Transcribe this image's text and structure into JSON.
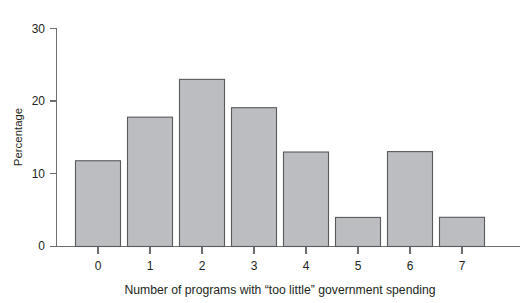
{
  "figure": {
    "cropped_header": "",
    "background_color": "#ffffff"
  },
  "chart_data": {
    "type": "bar",
    "title": "",
    "xlabel": "Number of programs with “too little” government spending",
    "ylabel": "Percentage",
    "categories": [
      "0",
      "1",
      "2",
      "3",
      "4",
      "5",
      "6",
      "7"
    ],
    "values": [
      3.8,
      6.7,
      11.8,
      17.8,
      23.0,
      19.1,
      13.0,
      4.0
    ],
    "ylim": [
      0,
      30
    ],
    "yticks": [
      0,
      10,
      20,
      30
    ],
    "ytick_labels": [
      "0",
      "10",
      "20",
      "30"
    ],
    "xtick_labels": [
      "0",
      "1",
      "2",
      "3",
      "4",
      "5",
      "6",
      "7"
    ],
    "grid": false,
    "legend": null,
    "bar_fill_color": "#bcbdc0",
    "bar_edge_color": "#58595b",
    "axis_color": "#6d6e71"
  }
}
